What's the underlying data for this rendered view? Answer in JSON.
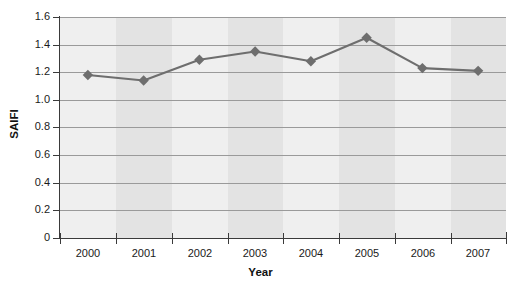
{
  "chart_data": {
    "type": "line",
    "title": "",
    "xlabel": "Year",
    "ylabel": "SAIFI",
    "categories": [
      "2000",
      "2001",
      "2002",
      "2003",
      "2004",
      "2005",
      "2006",
      "2007"
    ],
    "values": [
      1.18,
      1.14,
      1.29,
      1.35,
      1.28,
      1.45,
      1.23,
      1.21
    ],
    "series": [
      {
        "name": "SAIFI",
        "values": [
          1.18,
          1.14,
          1.29,
          1.35,
          1.28,
          1.45,
          1.23,
          1.21
        ],
        "marker": "diamond",
        "color": "#6e6e6e"
      }
    ],
    "ylim": [
      0,
      1.6
    ],
    "ytick_labels": [
      "1.6",
      "1.4",
      "1.2",
      "1.0",
      "0.8",
      "0.6",
      "0.4",
      "0.2",
      "0"
    ],
    "ytick_values": [
      1.6,
      1.4,
      1.2,
      1.0,
      0.8,
      0.6,
      0.4,
      0.2,
      0
    ],
    "grid": "horizontal",
    "legend": "none",
    "plot_background": "#eeeeee",
    "band_colors": [
      "#efefef",
      "#e3e3e3"
    ],
    "gridline_color": "#9a9a9a",
    "axis_color": "#3a3a3a"
  }
}
